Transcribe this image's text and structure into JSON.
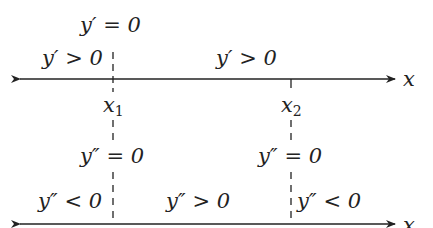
{
  "diagram": {
    "colors": {
      "ink": "#222222",
      "background": "#ffffff"
    },
    "axis1": {
      "axis_label": "x",
      "points": [
        {
          "name": "x",
          "sub": "1",
          "x": 113
        },
        {
          "name": "x",
          "sub": "2",
          "x": 291
        }
      ],
      "labels": {
        "above_x1": "y′ = 0",
        "left_region": "y′ > 0",
        "middle_region": "y′ > 0"
      }
    },
    "axis2": {
      "axis_label": "x",
      "labels": {
        "at_x1": "y″ = 0",
        "at_x2": "y″ = 0",
        "left_region": "y″ < 0",
        "middle_region": "y″ > 0",
        "right_region": "y″ < 0"
      }
    }
  }
}
